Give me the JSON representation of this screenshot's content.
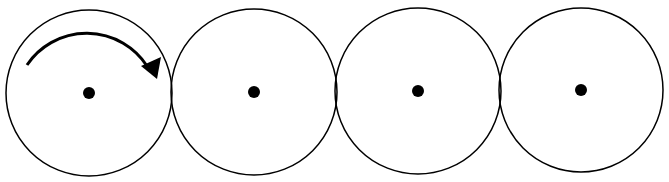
{
  "diagram": {
    "colors": {
      "stroke": "#000000",
      "fill": "#ffffff",
      "dot": "#000000"
    },
    "circles": [
      {
        "id": "circle-1",
        "cx": 89,
        "cy": 93,
        "r": 83,
        "has_rotation_arrow": true
      },
      {
        "id": "circle-2",
        "cx": 254,
        "cy": 92,
        "r": 83,
        "has_rotation_arrow": false
      },
      {
        "id": "circle-3",
        "cx": 418,
        "cy": 91,
        "r": 83,
        "has_rotation_arrow": false
      },
      {
        "id": "circle-4",
        "cx": 581,
        "cy": 90,
        "r": 82,
        "has_rotation_arrow": false
      }
    ],
    "center_dot_radius": 6,
    "rotation_arrow": {
      "direction": "clockwise",
      "on": "circle-1"
    }
  }
}
